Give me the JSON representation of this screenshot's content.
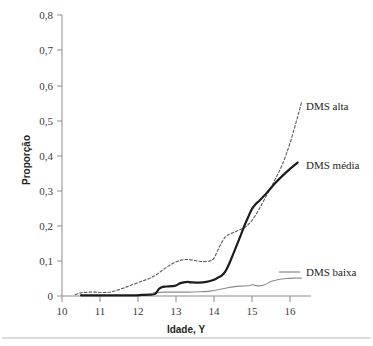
{
  "figure": {
    "background_color": "#ffffff",
    "footer_rule_color": "#b9b9b9"
  },
  "chart_data": {
    "type": "line",
    "title": "",
    "subtitle": "",
    "xlabel": "Idade, Y",
    "ylabel": "Proporção",
    "xlim": [
      10,
      16.4
    ],
    "ylim": [
      0,
      0.8
    ],
    "grid": false,
    "legend_position": "inline-right-of-curve-ends",
    "x_ticks": [
      10,
      11,
      12,
      13,
      14,
      15,
      16
    ],
    "x_tick_labels": [
      "10",
      "11",
      "12",
      "13",
      "14",
      "15",
      "16"
    ],
    "y_ticks": [
      0,
      0.1,
      0.2,
      0.3,
      0.4,
      0.5,
      0.6,
      0.7,
      0.8
    ],
    "y_tick_labels": [
      "0",
      "0,1",
      "0,2",
      "0,3",
      "0,4",
      "0,5",
      "0,6",
      "0,7",
      "0,8"
    ],
    "series": [
      {
        "name": "DMS alta",
        "style": "dashed",
        "color": "#5a5a5a",
        "label": "DMS alta",
        "x": [
          10.35,
          10.5,
          10.7,
          10.9,
          11.1,
          11.3,
          11.5,
          11.7,
          11.9,
          12.1,
          12.3,
          12.5,
          12.7,
          12.9,
          13.1,
          13.3,
          13.5,
          13.7,
          13.9,
          14.0,
          14.1,
          14.2,
          14.3,
          14.4,
          14.5,
          14.6,
          14.8,
          15.0,
          15.2,
          15.4,
          15.6,
          15.8,
          16.0,
          16.2,
          16.3
        ],
        "y": [
          0.004,
          0.009,
          0.011,
          0.011,
          0.01,
          0.012,
          0.018,
          0.026,
          0.034,
          0.042,
          0.05,
          0.062,
          0.078,
          0.092,
          0.101,
          0.104,
          0.101,
          0.098,
          0.1,
          0.108,
          0.13,
          0.152,
          0.168,
          0.176,
          0.18,
          0.185,
          0.195,
          0.215,
          0.25,
          0.29,
          0.33,
          0.375,
          0.435,
          0.51,
          0.55
        ]
      },
      {
        "name": "DMS média",
        "style": "solid-thick",
        "color": "#1c1c1c",
        "label": "DMS média",
        "x": [
          10.5,
          10.8,
          11.0,
          11.3,
          11.6,
          11.9,
          12.1,
          12.3,
          12.45,
          12.55,
          12.65,
          12.75,
          12.9,
          13.0,
          13.1,
          13.2,
          13.3,
          13.4,
          13.6,
          13.8,
          14.0,
          14.1,
          14.2,
          14.3,
          14.4,
          14.5,
          14.6,
          14.7,
          14.8,
          14.9,
          15.0,
          15.1,
          15.2,
          15.4,
          15.6,
          15.8,
          16.0,
          16.2
        ],
        "y": [
          0.002,
          0.002,
          0.002,
          0.002,
          0.002,
          0.002,
          0.003,
          0.004,
          0.006,
          0.02,
          0.026,
          0.027,
          0.028,
          0.03,
          0.036,
          0.039,
          0.04,
          0.039,
          0.038,
          0.04,
          0.046,
          0.052,
          0.058,
          0.07,
          0.092,
          0.118,
          0.145,
          0.172,
          0.2,
          0.225,
          0.248,
          0.262,
          0.272,
          0.295,
          0.32,
          0.342,
          0.362,
          0.38
        ]
      },
      {
        "name": "DMS baixa",
        "style": "solid-thin",
        "color": "#8a8a8a",
        "label": "DMS baixa",
        "x": [
          12.4,
          12.7,
          13.0,
          13.3,
          13.6,
          13.9,
          14.1,
          14.3,
          14.5,
          14.7,
          14.9,
          15.0,
          15.1,
          15.2,
          15.35,
          15.5,
          15.7,
          15.9,
          16.1,
          16.3
        ],
        "y": [
          0.009,
          0.011,
          0.011,
          0.011,
          0.012,
          0.014,
          0.018,
          0.022,
          0.026,
          0.028,
          0.029,
          0.032,
          0.03,
          0.029,
          0.033,
          0.041,
          0.047,
          0.05,
          0.051,
          0.051
        ]
      }
    ],
    "annotations": [
      {
        "text": "DMS alta",
        "series": "DMS alta"
      },
      {
        "text": "DMS média",
        "series": "DMS média"
      },
      {
        "text": "DMS baixa",
        "series": "DMS baixa"
      }
    ]
  }
}
